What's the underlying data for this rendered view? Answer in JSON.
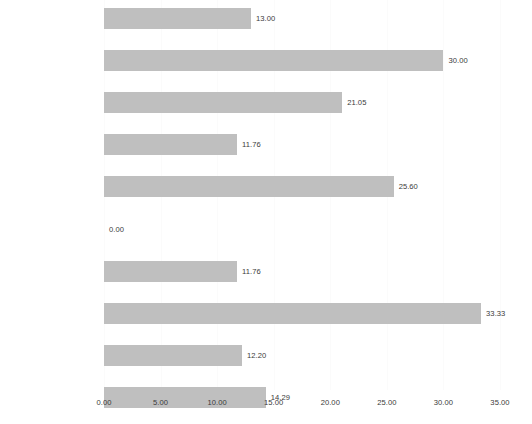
{
  "chart_data": {
    "type": "bar",
    "orientation": "horizontal",
    "title": "",
    "subtitle": "",
    "xlabel": "",
    "ylabel": "",
    "xlim": [
      0,
      35
    ],
    "xticks": [
      "0.00",
      "5.00",
      "10.00",
      "15.00",
      "20.00",
      "25.00",
      "30.00",
      "35.00"
    ],
    "xtick_values": [
      0,
      5,
      10,
      15,
      20,
      25,
      30,
      35
    ],
    "grid": true,
    "legend": false,
    "bar_color": "#bfbfbf",
    "text_color": "#3a3a3a",
    "categories": [
      "Lehrstühle*",
      "Oberärztliche Stellen*",
      "Vorstand BÄK",
      "Kammer-Präsidentinnen",
      "Kammer-Vorstände",
      "Vorstand KBV",
      "KV-Vorsitz",
      "KV Vertreterversammlungen",
      "KV Vorstände",
      "Berufsverbände"
    ],
    "values": [
      13.0,
      30.0,
      21.05,
      11.76,
      25.6,
      0.0,
      11.76,
      33.33,
      12.2,
      14.29
    ],
    "value_labels": [
      "13.00",
      "30.00",
      "21.05",
      "11.76",
      "25.60",
      "0.00",
      "11.76",
      "33.33",
      "12.20",
      "14.29"
    ]
  }
}
